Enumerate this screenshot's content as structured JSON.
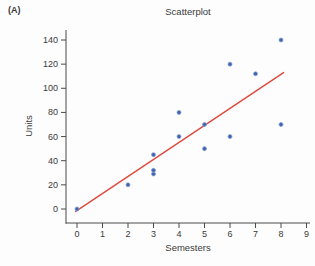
{
  "figure_label": "(A)",
  "chart_data": {
    "type": "scatter",
    "title": "Scatterplot",
    "xlabel": "Semesters",
    "ylabel": "Units",
    "xlim": [
      0,
      9
    ],
    "ylim": [
      0,
      140
    ],
    "x_ticks": [
      0,
      1,
      2,
      3,
      4,
      5,
      6,
      7,
      8,
      9
    ],
    "y_ticks": [
      0,
      20,
      40,
      60,
      80,
      100,
      120,
      140
    ],
    "points": [
      [
        0,
        0
      ],
      [
        2,
        20
      ],
      [
        3,
        29
      ],
      [
        3,
        32
      ],
      [
        3,
        45
      ],
      [
        4,
        60
      ],
      [
        4,
        80
      ],
      [
        5,
        50
      ],
      [
        5,
        70
      ],
      [
        6,
        60
      ],
      [
        6,
        120
      ],
      [
        7,
        112
      ],
      [
        8,
        70
      ],
      [
        8,
        140
      ]
    ],
    "trend_line": {
      "x1": -0.05,
      "y1": -2,
      "x2": 8.1,
      "y2": 113
    },
    "grid": false,
    "legend": "none",
    "point_color": "#3b63b0",
    "point_halo_color": "#8aa0d2",
    "line_color": "#e0493c",
    "axis_color": "#4a4a4a",
    "text_color": "#3a3a3a",
    "background": "#fdfdfd"
  }
}
